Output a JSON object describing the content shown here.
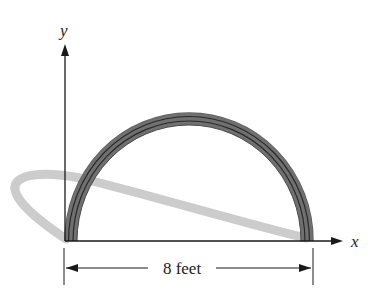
{
  "diagram": {
    "type": "semicircular-arch",
    "axes": {
      "y_label": "y",
      "x_label": "x"
    },
    "dimension": {
      "label": "8 feet",
      "span_feet": 8
    },
    "colors": {
      "arch_band": "#6e6e6e",
      "arch_lines": "#2a2a2a",
      "shadow": "#cfcfcf",
      "axes": "#1a1a1a"
    }
  }
}
